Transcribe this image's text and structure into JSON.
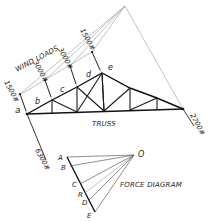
{
  "diagram": {
    "title_wind": "WIND LOADS",
    "title_truss": "TRUSS",
    "title_force": "FORCE DIAGRAM",
    "space_labels": [
      "a",
      "b",
      "c",
      "d",
      "e"
    ],
    "wind_loads": [
      {
        "value": "1500#",
        "position": "left support"
      },
      {
        "value": "3000#",
        "position": "joint 1"
      },
      {
        "value": "3000#",
        "position": "joint 2"
      },
      {
        "value": "1500#",
        "position": "apex"
      }
    ],
    "reactions": [
      {
        "value": "6300#",
        "position": "left support"
      },
      {
        "value": "2700#",
        "position": "right support"
      }
    ],
    "force_diagram": {
      "pole": "O",
      "points": [
        "A",
        "B",
        "C",
        "R",
        "D",
        "E"
      ]
    },
    "colors": {
      "line": "#1a1a1a",
      "construction": "#9a9a9a",
      "background": "#ffffff"
    }
  }
}
